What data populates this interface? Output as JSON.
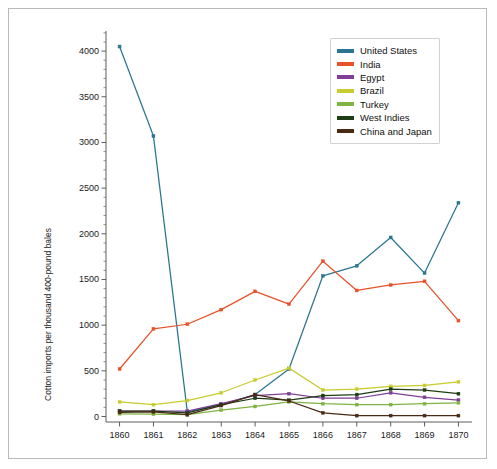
{
  "chart_data": {
    "type": "line",
    "title": "",
    "subtitle": "",
    "xlabel": "",
    "ylabel": "Cotton imports per thousand 400-pound bales",
    "x": [
      1860,
      1861,
      1862,
      1863,
      1864,
      1865,
      1866,
      1867,
      1868,
      1869,
      1870
    ],
    "xticklabels": [
      "1860",
      "1861",
      "1862",
      "1863",
      "1864",
      "1865",
      "1866",
      "1867",
      "1868",
      "1869",
      "1870"
    ],
    "yticklabels": [
      "0",
      "500",
      "1000",
      "1500",
      "2000",
      "2500",
      "3000",
      "3500",
      "4000"
    ],
    "yticks": [
      0,
      500,
      1000,
      1500,
      2000,
      2500,
      3000,
      3500,
      4000
    ],
    "xlim": [
      1859.6,
      1870.4
    ],
    "ylim": [
      -60,
      4220
    ],
    "grid": false,
    "legend_position": "top-right",
    "marker": "square",
    "series": [
      {
        "name": "United States",
        "color": "#2a7590",
        "values": [
          4050,
          3070,
          50,
          130,
          240,
          520,
          1540,
          1650,
          1960,
          1570,
          2340
        ]
      },
      {
        "name": "India",
        "color": "#e8512a",
        "values": [
          520,
          960,
          1010,
          1170,
          1370,
          1230,
          1700,
          1380,
          1440,
          1480,
          1050
        ]
      },
      {
        "name": "Egypt",
        "color": "#7f3f98",
        "values": [
          60,
          60,
          60,
          140,
          230,
          250,
          200,
          200,
          260,
          210,
          180
        ]
      },
      {
        "name": "Brazil",
        "color": "#c8cc2e",
        "values": [
          160,
          130,
          175,
          260,
          400,
          530,
          290,
          300,
          330,
          340,
          380
        ]
      },
      {
        "name": "Turkey",
        "color": "#7fb342",
        "values": [
          30,
          25,
          20,
          70,
          110,
          160,
          140,
          130,
          130,
          140,
          150
        ]
      },
      {
        "name": "West Indies",
        "color": "#1f3d14",
        "values": [
          60,
          60,
          40,
          130,
          200,
          180,
          230,
          240,
          300,
          290,
          250
        ]
      },
      {
        "name": "China and Japan",
        "color": "#4a2a14",
        "values": [
          45,
          50,
          20,
          120,
          240,
          170,
          40,
          10,
          10,
          10,
          10
        ]
      }
    ]
  },
  "legend": {
    "items": [
      {
        "label": "United States",
        "color": "#2a7590"
      },
      {
        "label": "India",
        "color": "#e8512a"
      },
      {
        "label": "Egypt",
        "color": "#7f3f98"
      },
      {
        "label": "Brazil",
        "color": "#c8cc2e"
      },
      {
        "label": "Turkey",
        "color": "#7fb342"
      },
      {
        "label": "West Indies",
        "color": "#1f3d14"
      },
      {
        "label": "China and Japan",
        "color": "#4a2a14"
      }
    ]
  },
  "axes": {
    "ylabel": "Cotton imports per thousand 400-pound bales"
  }
}
